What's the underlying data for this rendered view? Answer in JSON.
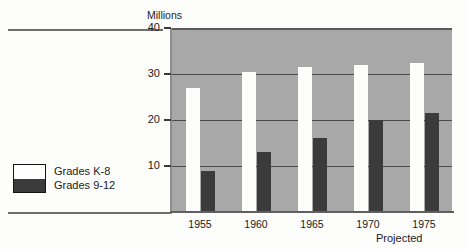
{
  "chart_data": {
    "type": "bar",
    "title": "",
    "subtitle": "",
    "xlabel": "",
    "ylabel": "Millions",
    "categories": [
      "1955",
      "1960",
      "1965",
      "1970",
      "1975"
    ],
    "series": [
      {
        "name": "Grades K-8",
        "color": "#ffffff",
        "values": [
          27.0,
          30.5,
          31.5,
          32.0,
          32.5
        ]
      },
      {
        "name": "Grades 9-12",
        "color": "#3b3b3b",
        "values": [
          9.0,
          13.0,
          16.0,
          20.0,
          21.5
        ]
      }
    ],
    "ylim": [
      0,
      40
    ],
    "yticks": [
      40,
      30,
      20,
      10
    ],
    "ytick_labels": [
      "40",
      "30",
      "20",
      "10"
    ],
    "grid": true,
    "legend_position": "left-outside",
    "annotations": [
      {
        "text": "Projected",
        "near_category": "1975"
      }
    ],
    "plot_background": "#a8a8a8"
  },
  "axis": {
    "y_title": "Millions",
    "ticks": [
      {
        "label": "40"
      },
      {
        "label": "30"
      },
      {
        "label": "20"
      },
      {
        "label": "10"
      }
    ]
  },
  "xaxis": {
    "labels": [
      {
        "text": "1955"
      },
      {
        "text": "1960"
      },
      {
        "text": "1965"
      },
      {
        "text": "1970"
      },
      {
        "text": "1975"
      }
    ],
    "note": "Projected"
  },
  "legend": {
    "items": [
      {
        "label": "Grades K-8",
        "color": "#ffffff"
      },
      {
        "label": "Grades 9-12",
        "color": "#3b3b3b"
      }
    ]
  }
}
